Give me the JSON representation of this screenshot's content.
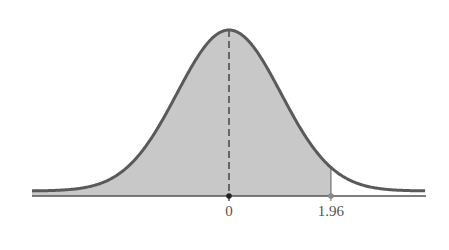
{
  "chart_data": {
    "type": "area",
    "title": "",
    "xlabel": "",
    "ylabel": "",
    "x_ticks": [
      {
        "value": 0,
        "label": "0"
      },
      {
        "value": 1.96,
        "label": "1.96"
      }
    ],
    "xlim": [
      -3.8,
      3.8
    ],
    "mean": 0,
    "sd": 1,
    "shaded_region": {
      "from": "-inf",
      "to": 1.96
    },
    "mean_line": "dashed",
    "grid": false,
    "legend": null
  },
  "colors": {
    "curve": "#5a5a5a",
    "fill": "#c8c8c8",
    "axis": "#555555",
    "label": "#555555"
  }
}
